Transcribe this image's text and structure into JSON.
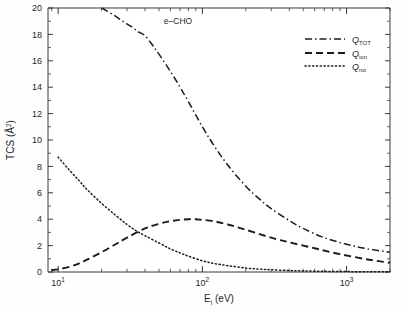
{
  "figure": {
    "annotation": "e–CHO",
    "background_color": "#fefefe",
    "line_color": "#1c1c1c"
  },
  "axes": {
    "x": {
      "label_main": "E",
      "label_sub": "i",
      "label_unit": " (eV)",
      "scale": "log",
      "min": 8.5,
      "max": 2000,
      "tick_labels": [
        "10",
        "10",
        "10"
      ],
      "tick_exponents": [
        "1",
        "2",
        "3"
      ],
      "tick_values": [
        10,
        100,
        1000
      ]
    },
    "y": {
      "label_main": "TCS (Å",
      "label_sup": "2",
      "label_close": ")",
      "scale": "linear",
      "min": 0,
      "max": 20,
      "tick_values": [
        0,
        2,
        4,
        6,
        8,
        10,
        12,
        14,
        16,
        18,
        20
      ],
      "tick_labels": [
        "0",
        "2",
        "4",
        "6",
        "8",
        "10",
        "12",
        "14",
        "16",
        "18",
        "20"
      ]
    }
  },
  "legend": {
    "position": "top-right",
    "items": [
      {
        "label_main": "Q",
        "label_sub": "TOT",
        "style": "dash-dot"
      },
      {
        "label_main": "Q",
        "label_sub": "ion",
        "style": "dashed"
      },
      {
        "label_main": "Q",
        "label_sub": "rot",
        "style": "dotted"
      }
    ]
  },
  "chart_data": {
    "type": "line",
    "title": "",
    "subtitle": "",
    "annotation": "e–CHO",
    "xlabel": "E_i (eV)",
    "ylabel": "TCS (Å²)",
    "xscale": "log",
    "yscale": "linear",
    "xlim": [
      8.5,
      2000
    ],
    "ylim": [
      0,
      20
    ],
    "grid": false,
    "legend_position": "top-right",
    "series": [
      {
        "name": "Q_TOT",
        "label": "QTOT",
        "style": "dash-dot",
        "x": [
          20,
          24,
          28,
          32,
          36,
          40,
          45,
          50,
          60,
          70,
          80,
          100,
          120,
          150,
          200,
          250,
          300,
          400,
          500,
          700,
          1000,
          1400,
          2000
        ],
        "y": [
          20.0,
          19.5,
          19.0,
          18.6,
          18.2,
          17.9,
          17.2,
          16.5,
          15.2,
          14.0,
          12.9,
          11.0,
          9.6,
          8.1,
          6.5,
          5.5,
          4.8,
          3.9,
          3.3,
          2.6,
          2.1,
          1.75,
          1.5
        ]
      },
      {
        "name": "Q_ion",
        "label": "Qion",
        "style": "dashed",
        "x": [
          9,
          10,
          12,
          14,
          16,
          20,
          25,
          30,
          40,
          50,
          60,
          70,
          80,
          90,
          100,
          120,
          150,
          200,
          300,
          400,
          600,
          900,
          1400,
          2000
        ],
        "y": [
          0.15,
          0.2,
          0.4,
          0.65,
          0.95,
          1.5,
          2.1,
          2.6,
          3.3,
          3.65,
          3.85,
          3.95,
          4.0,
          4.0,
          3.95,
          3.85,
          3.6,
          3.2,
          2.6,
          2.25,
          1.8,
          1.35,
          0.95,
          0.7
        ]
      },
      {
        "name": "Q_rot",
        "label": "Qrot",
        "style": "dotted",
        "x": [
          10,
          12,
          14,
          16,
          20,
          25,
          30,
          35,
          40,
          50,
          60,
          70,
          80,
          100,
          120,
          150,
          200,
          250,
          300,
          400,
          500,
          700,
          1000,
          1400,
          2000
        ],
        "y": [
          8.7,
          7.7,
          6.9,
          6.2,
          5.2,
          4.3,
          3.6,
          3.1,
          2.75,
          2.2,
          1.75,
          1.45,
          1.2,
          0.85,
          0.65,
          0.48,
          0.3,
          0.22,
          0.17,
          0.11,
          0.08,
          0.05,
          0.03,
          0.02,
          0.01
        ]
      }
    ]
  }
}
